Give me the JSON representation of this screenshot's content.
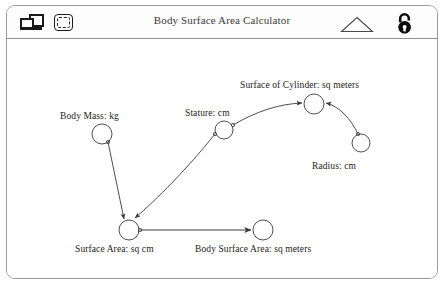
{
  "window": {
    "title": "Body Surface Area Calculator"
  },
  "toolbar": {
    "left_icons": [
      {
        "name": "windows-icon",
        "label": "Windows"
      },
      {
        "name": "selection-icon",
        "label": "Selection"
      }
    ],
    "right_icons": [
      {
        "name": "triangle-icon",
        "label": "Triangle"
      },
      {
        "name": "unlock-icon",
        "label": "Unlock"
      }
    ]
  },
  "graph": {
    "nodes": [
      {
        "id": "body-mass",
        "label": "Body Mass: kg",
        "cx": 95,
        "cy": 95,
        "r": 10,
        "label_x": 53,
        "label_y": 72
      },
      {
        "id": "stature",
        "label": "Stature: cm",
        "cx": 217,
        "cy": 91,
        "r": 9,
        "label_x": 178,
        "label_y": 69
      },
      {
        "id": "surface-of-cylinder",
        "label": "Surface of Cylinder: sq meters",
        "cx": 307,
        "cy": 65,
        "r": 10,
        "label_x": 233,
        "label_y": 41
      },
      {
        "id": "radius",
        "label": "Radius: cm",
        "cx": 354,
        "cy": 104,
        "r": 9,
        "label_x": 305,
        "label_y": 122
      },
      {
        "id": "surface-area",
        "label": "Surface Area: sq cm",
        "cx": 122,
        "cy": 191,
        "r": 10,
        "label_x": 68,
        "label_y": 205
      },
      {
        "id": "body-surface-area",
        "label": "Body Surface Area: sq meters",
        "cx": 256,
        "cy": 191,
        "r": 10,
        "label_x": 188,
        "label_y": 205
      }
    ],
    "edges": [
      {
        "from": "body-mass",
        "to": "surface-area",
        "kind": "straight"
      },
      {
        "from": "stature",
        "to": "surface-area",
        "kind": "curve"
      },
      {
        "from": "stature",
        "to": "surface-of-cylinder",
        "kind": "curve"
      },
      {
        "from": "radius",
        "to": "surface-of-cylinder",
        "kind": "curve"
      },
      {
        "from": "surface-area",
        "to": "body-surface-area",
        "kind": "straight"
      }
    ]
  },
  "colors": {
    "stroke": "#3a3a3a",
    "frame": "#9a9a9a",
    "text": "#1c1c1c"
  }
}
